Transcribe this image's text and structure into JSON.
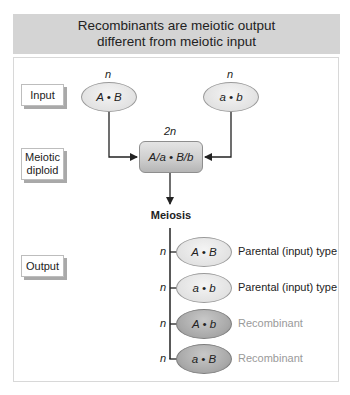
{
  "title": {
    "line1": "Recombinants are meiotic output",
    "line2": "different from meiotic input"
  },
  "row_labels": {
    "input": "Input",
    "diploid_line1": "Meiotic",
    "diploid_line2": "diploid",
    "output": "Output"
  },
  "inputs": [
    {
      "ploidy": "n",
      "genotype": "A • B"
    },
    {
      "ploidy": "n",
      "genotype": "a • b"
    }
  ],
  "diploid": {
    "ploidy": "2n",
    "genotype": "A/a • B/b"
  },
  "process_label": "Meiosis",
  "outputs": [
    {
      "ploidy": "n",
      "genotype": "A • B",
      "type": "Parental (input) type"
    },
    {
      "ploidy": "n",
      "genotype": "a • b",
      "type": "Parental (input) type"
    },
    {
      "ploidy": "n",
      "genotype": "A • b",
      "type": "Recombinant"
    },
    {
      "ploidy": "n",
      "genotype": "a • B",
      "type": "Recombinant"
    }
  ],
  "colors": {
    "header_bg": "#d4d4d4",
    "parental_fill": "#e2e2e2",
    "recombinant_fill": "#a9a9a9",
    "recombinant_text": "#9a9a9a",
    "line": "#222222"
  }
}
